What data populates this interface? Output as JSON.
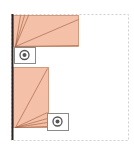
{
  "view": {
    "width": 134,
    "height": 153,
    "background_color": "#ffffff",
    "title": "Sensor coverage floor plan"
  },
  "colors": {
    "coverage_fill": "#f5c0a8",
    "coverage_stroke": "#c98a6b",
    "ray_line": "#9a5a3c",
    "wall": "#2b2220",
    "room_outline_dashed": "#cfcfcf",
    "device_box_stroke": "#8a8a8a",
    "device_box_fill": "#ffffff",
    "device_glyph": "#555555"
  },
  "room": {
    "label": "room-boundary",
    "outline": {
      "x": 11,
      "y": 14,
      "width": 117,
      "height": 126,
      "style": "dashed",
      "dash_pattern": "2 2",
      "stroke_width": 1
    },
    "wall": {
      "label": "left-wall",
      "x1": 12,
      "y1": 14,
      "x2": 12,
      "y2": 140,
      "stroke_width": 2
    }
  },
  "coverage_regions": [
    {
      "id": "coverage-upper",
      "label": "Upper sensor coverage",
      "shape": "rectangle",
      "x": 13,
      "y": 15,
      "width": 65,
      "height": 31,
      "origin": {
        "x": 15,
        "y": 46
      },
      "rays": [
        {
          "to_x": 20,
          "to_y": 15
        },
        {
          "to_x": 24,
          "to_y": 15
        },
        {
          "to_x": 28,
          "to_y": 15
        },
        {
          "to_x": 78,
          "to_y": 19
        },
        {
          "to_x": 78,
          "to_y": 45
        }
      ]
    },
    {
      "id": "coverage-lower",
      "label": "Lower sensor coverage",
      "shape": "rectangle",
      "x": 13,
      "y": 67,
      "width": 35,
      "height": 60,
      "origin": {
        "x": 15,
        "y": 127
      },
      "rays": [
        {
          "to_x": 47,
          "to_y": 68
        },
        {
          "to_x": 47,
          "to_y": 112
        },
        {
          "to_x": 47,
          "to_y": 118
        },
        {
          "to_x": 47,
          "to_y": 122
        },
        {
          "to_x": 47,
          "to_y": 126
        }
      ]
    }
  ],
  "devices": [
    {
      "id": "device-upper",
      "icon_name": "sensor-icon",
      "box": {
        "x": 14,
        "y": 47,
        "width": 21,
        "height": 16
      },
      "glyph": {
        "cx": 24.5,
        "cy": 55,
        "outer_r": 4.5,
        "inner_r": 2.0
      }
    },
    {
      "id": "device-lower",
      "icon_name": "sensor-icon",
      "box": {
        "x": 47,
        "y": 113,
        "width": 21,
        "height": 17
      },
      "glyph": {
        "cx": 57.5,
        "cy": 121.5,
        "outer_r": 4.5,
        "inner_r": 2.0
      }
    }
  ]
}
